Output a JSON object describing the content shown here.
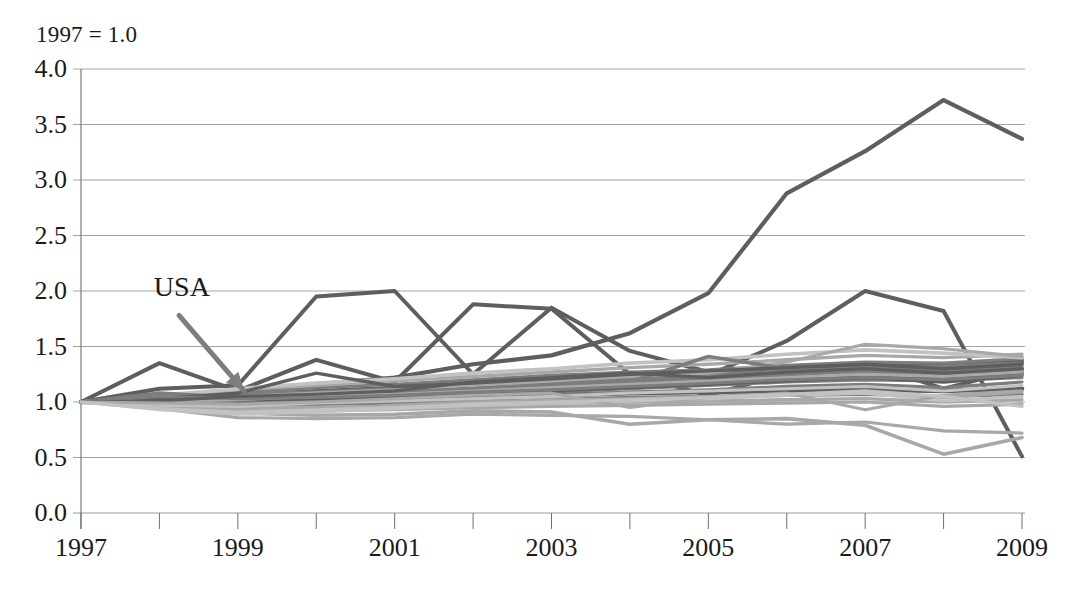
{
  "chart_data": {
    "type": "line",
    "title": "1997 = 1.0",
    "xlabel": "",
    "ylabel": "",
    "xlim": [
      1997,
      2009
    ],
    "ylim": [
      0.0,
      4.0
    ],
    "grid": true,
    "legend": false,
    "legend_position": "none",
    "x": [
      1997,
      1998,
      1999,
      2000,
      2001,
      2002,
      2003,
      2004,
      2005,
      2006,
      2007,
      2008,
      2009
    ],
    "x_tick_labels": [
      "1997",
      "1999",
      "2001",
      "2003",
      "2005",
      "2007",
      "2009"
    ],
    "x_tick_values": [
      1997,
      1999,
      2001,
      2003,
      2005,
      2007,
      2009
    ],
    "y_tick_labels": [
      "0.0",
      "0.5",
      "1.0",
      "1.5",
      "2.0",
      "2.5",
      "3.0",
      "3.5",
      "4.0"
    ],
    "y_tick_values": [
      0.0,
      0.5,
      1.0,
      1.5,
      2.0,
      2.5,
      3.0,
      3.5,
      4.0
    ],
    "annotations": [
      {
        "text": "USA",
        "x_label": 1998.35,
        "y_label": 2.02,
        "arrow_from": [
          1998.25,
          1.78
        ],
        "arrow_to": [
          1999.08,
          1.1
        ]
      }
    ],
    "colors": {
      "line_dark": "#5e5e5e",
      "line_mid": "#7d7d7d",
      "line_light": "#a8a8a8",
      "line_pale": "#c2c2c2",
      "grid": "#9a9a9a",
      "axis": "#6f6f6f",
      "text": "#1a1a1a"
    },
    "series": [
      {
        "name": "series-top-riser",
        "shade": "dark",
        "width": 4.2,
        "values": [
          1.0,
          1.04,
          1.1,
          1.16,
          1.22,
          1.34,
          1.42,
          1.62,
          1.98,
          2.88,
          3.26,
          3.72,
          3.37
        ]
      },
      {
        "name": "series-early-peak",
        "shade": "dark",
        "width": 4.0,
        "values": [
          1.0,
          1.12,
          1.15,
          1.95,
          2.0,
          1.25,
          1.85,
          1.46,
          1.27,
          1.3,
          1.33,
          1.28,
          1.36
        ]
      },
      {
        "name": "series-mid-peak-2003",
        "shade": "dark",
        "width": 4.0,
        "values": [
          1.0,
          1.35,
          1.1,
          1.38,
          1.18,
          1.88,
          1.84,
          1.25,
          1.06,
          1.26,
          1.35,
          1.12,
          1.3
        ]
      },
      {
        "name": "series-late-spike-2007",
        "shade": "dark",
        "width": 4.0,
        "values": [
          1.0,
          1.02,
          1.05,
          1.08,
          1.1,
          1.14,
          1.2,
          1.22,
          1.24,
          1.55,
          2.0,
          1.82,
          0.51
        ]
      },
      {
        "name": "series-low-dip",
        "shade": "light",
        "width": 3.6,
        "values": [
          1.0,
          0.96,
          0.9,
          0.88,
          0.89,
          0.92,
          0.91,
          0.8,
          0.84,
          0.85,
          0.79,
          0.53,
          0.68
        ]
      },
      {
        "name": "series-low-flat",
        "shade": "light",
        "width": 3.2,
        "values": [
          1.0,
          0.94,
          0.86,
          0.85,
          0.86,
          0.89,
          0.88,
          0.87,
          0.84,
          0.8,
          0.82,
          0.74,
          0.72
        ]
      },
      {
        "name": "series-band-a",
        "shade": "dark",
        "width": 3.6,
        "values": [
          1.0,
          1.02,
          1.06,
          1.1,
          1.13,
          1.16,
          1.2,
          1.24,
          1.27,
          1.3,
          1.33,
          1.34,
          1.38
        ]
      },
      {
        "name": "series-band-b",
        "shade": "mid",
        "width": 3.4,
        "values": [
          1.0,
          1.01,
          1.04,
          1.07,
          1.1,
          1.14,
          1.18,
          1.21,
          1.25,
          1.28,
          1.31,
          1.32,
          1.35
        ]
      },
      {
        "name": "series-band-c",
        "shade": "mid",
        "width": 3.4,
        "values": [
          1.0,
          1.03,
          1.07,
          1.09,
          1.12,
          1.15,
          1.17,
          1.2,
          1.23,
          1.26,
          1.3,
          1.29,
          1.33
        ]
      },
      {
        "name": "series-band-d",
        "shade": "dark",
        "width": 3.8,
        "values": [
          1.0,
          1.0,
          1.02,
          1.04,
          1.06,
          1.09,
          1.12,
          1.15,
          1.18,
          1.2,
          1.23,
          1.22,
          1.26
        ]
      },
      {
        "name": "series-band-e",
        "shade": "mid",
        "width": 3.2,
        "values": [
          1.0,
          0.99,
          1.0,
          1.02,
          1.04,
          1.07,
          1.09,
          1.12,
          1.15,
          1.18,
          1.2,
          1.19,
          1.22
        ]
      },
      {
        "name": "series-band-f",
        "shade": "dark",
        "width": 4.6,
        "values": [
          1.0,
          1.0,
          1.01,
          1.02,
          1.03,
          1.05,
          1.06,
          1.08,
          1.09,
          1.1,
          1.11,
          1.1,
          1.12
        ]
      },
      {
        "name": "series-band-g",
        "shade": "mid",
        "width": 3.4,
        "values": [
          1.0,
          0.98,
          0.97,
          0.98,
          0.99,
          1.01,
          1.02,
          1.04,
          1.05,
          1.06,
          1.07,
          1.05,
          1.07
        ]
      },
      {
        "name": "series-band-h",
        "shade": "light",
        "width": 3.4,
        "values": [
          1.0,
          0.97,
          0.95,
          0.95,
          0.96,
          0.98,
          0.99,
          1.0,
          1.01,
          1.02,
          1.03,
          1.0,
          1.02
        ]
      },
      {
        "name": "series-band-i",
        "shade": "light",
        "width": 3.2,
        "values": [
          1.0,
          0.96,
          0.93,
          0.92,
          0.93,
          0.95,
          0.96,
          0.97,
          0.98,
          0.99,
          1.0,
          0.96,
          0.98
        ]
      },
      {
        "name": "series-band-j",
        "shade": "mid",
        "width": 3.2,
        "values": [
          1.0,
          1.04,
          1.09,
          1.13,
          1.16,
          1.2,
          1.24,
          1.27,
          1.29,
          1.33,
          1.36,
          1.35,
          1.39
        ]
      },
      {
        "name": "series-band-k",
        "shade": "light",
        "width": 3.4,
        "values": [
          1.0,
          1.05,
          1.11,
          1.15,
          1.19,
          1.23,
          1.27,
          1.31,
          1.34,
          1.38,
          1.42,
          1.4,
          1.43
        ]
      },
      {
        "name": "series-band-l",
        "shade": "pale",
        "width": 3.6,
        "values": [
          1.0,
          1.06,
          1.12,
          1.17,
          1.21,
          1.26,
          1.3,
          1.35,
          1.38,
          1.43,
          1.47,
          1.44,
          1.4
        ]
      },
      {
        "name": "series-band-m",
        "shade": "light",
        "width": 3.2,
        "values": [
          1.0,
          1.02,
          1.05,
          1.08,
          1.11,
          1.15,
          1.19,
          1.23,
          1.26,
          1.36,
          1.52,
          1.48,
          1.41
        ]
      },
      {
        "name": "series-band-n",
        "shade": "mid",
        "width": 3.4,
        "values": [
          1.0,
          1.01,
          1.03,
          1.06,
          1.08,
          1.12,
          1.15,
          1.18,
          1.21,
          1.24,
          1.28,
          1.27,
          1.31
        ]
      },
      {
        "name": "series-band-o",
        "shade": "dark",
        "width": 3.4,
        "values": [
          1.0,
          0.99,
          1.01,
          1.03,
          1.05,
          1.08,
          1.1,
          1.13,
          1.16,
          1.19,
          1.22,
          1.18,
          1.24
        ]
      },
      {
        "name": "series-band-p",
        "shade": "mid",
        "width": 3.2,
        "values": [
          1.0,
          0.98,
          0.99,
          1.0,
          1.02,
          1.04,
          1.06,
          1.09,
          1.11,
          1.14,
          1.16,
          1.13,
          1.18
        ]
      },
      {
        "name": "series-band-q",
        "shade": "light",
        "width": 3.0,
        "values": [
          1.0,
          0.95,
          0.92,
          0.94,
          0.97,
          1.0,
          1.02,
          1.03,
          1.05,
          1.07,
          1.09,
          1.04,
          1.09
        ]
      },
      {
        "name": "series-band-r",
        "shade": "pale",
        "width": 3.2,
        "values": [
          1.0,
          0.93,
          0.89,
          0.91,
          0.94,
          0.97,
          0.99,
          1.01,
          1.03,
          1.06,
          1.08,
          1.01,
          1.05
        ]
      },
      {
        "name": "series-band-s",
        "shade": "mid",
        "width": 3.6,
        "values": [
          1.0,
          1.08,
          1.04,
          1.06,
          1.09,
          1.12,
          1.15,
          1.18,
          1.41,
          1.3,
          1.26,
          1.24,
          1.28
        ]
      },
      {
        "name": "series-band-t",
        "shade": "dark",
        "width": 3.4,
        "values": [
          1.0,
          1.03,
          1.08,
          1.26,
          1.14,
          1.17,
          1.21,
          1.25,
          1.28,
          1.31,
          1.34,
          1.3,
          1.34
        ]
      },
      {
        "name": "series-band-u",
        "shade": "light",
        "width": 3.0,
        "values": [
          1.0,
          1.0,
          1.02,
          1.05,
          1.07,
          1.1,
          1.13,
          1.16,
          1.19,
          1.22,
          1.25,
          1.23,
          1.27
        ]
      },
      {
        "name": "series-band-v",
        "shade": "pale",
        "width": 3.0,
        "values": [
          1.0,
          0.97,
          0.96,
          0.99,
          1.01,
          1.03,
          1.05,
          1.08,
          1.1,
          1.12,
          1.14,
          1.1,
          1.15
        ]
      },
      {
        "name": "series-band-w",
        "shade": "mid",
        "width": 3.0,
        "values": [
          1.0,
          1.05,
          1.03,
          1.04,
          1.06,
          1.09,
          1.11,
          1.14,
          1.17,
          1.2,
          1.22,
          1.2,
          1.24
        ]
      },
      {
        "name": "series-band-x",
        "shade": "dark",
        "width": 3.2,
        "values": [
          1.0,
          1.01,
          1.05,
          1.07,
          1.1,
          1.18,
          1.22,
          1.26,
          1.22,
          1.27,
          1.3,
          1.26,
          1.3
        ]
      },
      {
        "name": "series-band-y",
        "shade": "light",
        "width": 3.0,
        "values": [
          1.0,
          0.99,
          0.98,
          1.0,
          1.03,
          1.06,
          1.08,
          0.95,
          1.04,
          1.08,
          0.93,
          1.06,
          1.1
        ]
      },
      {
        "name": "series-band-z",
        "shade": "pale",
        "width": 3.2,
        "values": [
          1.0,
          0.94,
          0.91,
          0.93,
          0.95,
          0.98,
          1.0,
          1.02,
          1.04,
          1.07,
          1.1,
          1.05,
          0.96
        ]
      }
    ]
  }
}
